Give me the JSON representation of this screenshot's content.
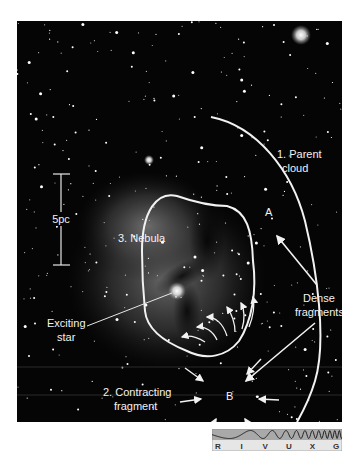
{
  "figure": {
    "labels": {
      "parent_cloud_line1": "1. Parent",
      "parent_cloud_line2": "cloud",
      "nebula": "3. Nebula",
      "scale": "5pc",
      "point_a": "A",
      "point_b": "B",
      "dense_line1": "Dense",
      "dense_line2": "fragments",
      "exciting_line1": "Exciting",
      "exciting_line2": "star",
      "contracting_line1": "2. Contracting",
      "contracting_line2": "fragment"
    },
    "colors": {
      "background": "#050505",
      "annotation": "#f2f2f2",
      "nebula_glow": "#6e6e6e"
    }
  },
  "spectrum_bar": {
    "bands": [
      "R",
      "I",
      "V",
      "U",
      "X",
      "G"
    ],
    "highlighted_band": "V",
    "colors": {
      "wave_area": "#a9a9a9",
      "label_area": "#e6e6e6",
      "wave_line": "#222222"
    }
  }
}
